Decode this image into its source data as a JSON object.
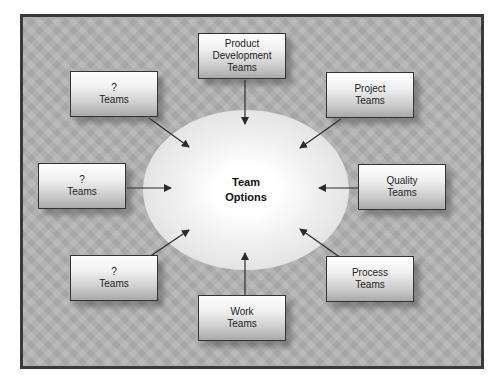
{
  "diagram": {
    "center": {
      "line1": "Team",
      "line2": "Options"
    },
    "boxes": [
      {
        "id": "product-development",
        "lines": [
          "Product",
          "Development",
          "Teams"
        ]
      },
      {
        "id": "unknown-top-left",
        "lines": [
          "?",
          "Teams"
        ]
      },
      {
        "id": "project",
        "lines": [
          "Project",
          "Teams"
        ]
      },
      {
        "id": "unknown-mid-left",
        "lines": [
          "?",
          "Teams"
        ]
      },
      {
        "id": "quality",
        "lines": [
          "Quality",
          "Teams"
        ]
      },
      {
        "id": "unknown-bottom-left",
        "lines": [
          "?",
          "Teams"
        ]
      },
      {
        "id": "process",
        "lines": [
          "Process",
          "Teams"
        ]
      },
      {
        "id": "work",
        "lines": [
          "Work",
          "Teams"
        ]
      }
    ],
    "colors": {
      "frame_border": "#3a3a3a",
      "background": "#b2b2b2",
      "arrow": "#2a2a2a"
    }
  }
}
